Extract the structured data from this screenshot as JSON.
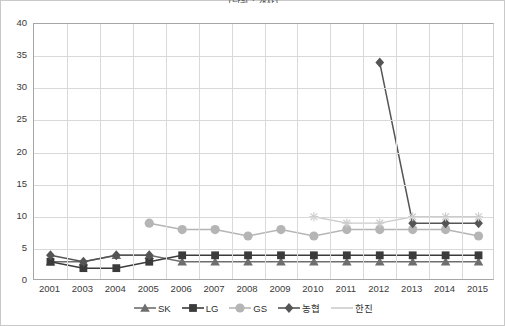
{
  "chart_title": "(단위 : 개사)",
  "axis": {
    "y_ticks": [
      0,
      5,
      10,
      15,
      20,
      25,
      30,
      35,
      40
    ],
    "ylim": [
      0,
      40
    ],
    "x_categories": [
      "2001",
      "2003",
      "2004",
      "2005",
      "2006",
      "2007",
      "2008",
      "2009",
      "2010",
      "2011",
      "2012",
      "2013",
      "2014",
      "2015"
    ]
  },
  "legend": {
    "items": [
      {
        "label": "SK",
        "marker": "triangle-marker",
        "color": "#6e6e6e"
      },
      {
        "label": "LG",
        "marker": "square-marker",
        "color": "#3b3b3b"
      },
      {
        "label": "GS",
        "marker": "circle-marker",
        "color": "#b5b5b5"
      },
      {
        "label": "농협",
        "marker": "diamond-marker",
        "color": "#555555"
      },
      {
        "label": "한진",
        "marker": "line-marker",
        "color": "#cccccc"
      }
    ]
  },
  "chart_data": {
    "type": "line",
    "title": "(단위 : 개사)",
    "xlabel": "",
    "ylabel": "",
    "ylim": [
      0,
      40
    ],
    "grid": true,
    "legend_position": "bottom",
    "categories": [
      "2001",
      "2003",
      "2004",
      "2005",
      "2006",
      "2007",
      "2008",
      "2009",
      "2010",
      "2011",
      "2012",
      "2013",
      "2014",
      "2015"
    ],
    "series": [
      {
        "name": "SK",
        "color": "#6e6e6e",
        "marker": "triangle",
        "values": [
          3,
          3,
          4,
          4,
          3,
          3,
          3,
          3,
          3,
          3,
          3,
          3,
          3,
          3
        ]
      },
      {
        "name": "LG",
        "color": "#3b3b3b",
        "marker": "square",
        "values": [
          3,
          2,
          2,
          3,
          4,
          4,
          4,
          4,
          4,
          4,
          4,
          4,
          4,
          4
        ]
      },
      {
        "name": "GS",
        "color": "#b5b5b5",
        "marker": "circle",
        "values": [
          null,
          null,
          null,
          9,
          8,
          8,
          7,
          8,
          7,
          8,
          8,
          8,
          8,
          7
        ]
      },
      {
        "name": "농협",
        "color": "#555555",
        "marker": "diamond",
        "values": [
          4,
          3,
          4,
          4,
          null,
          null,
          null,
          null,
          null,
          null,
          34,
          9,
          9,
          9
        ]
      },
      {
        "name": "한진",
        "color": "#cccccc",
        "marker": "star",
        "values": [
          null,
          null,
          null,
          null,
          null,
          null,
          null,
          null,
          10,
          9,
          9,
          10,
          10,
          10
        ]
      }
    ]
  }
}
